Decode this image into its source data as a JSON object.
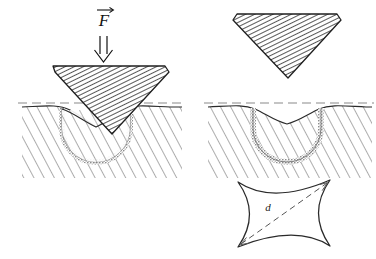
{
  "figure": {
    "title_visible": false,
    "background_color": "#ffffff",
    "ink_color": "#111111",
    "hatch_color": "#444444",
    "plastic_zone_color": "#808080",
    "dashed_surface_color": "#777777"
  },
  "labels": {
    "force": "F",
    "force_vector_accent": "→",
    "force_arrow_glyph": "⇓",
    "diagonal": "d"
  },
  "panels": [
    {
      "id": "loaded-indentation",
      "name": "Indenter under load pressed into specimen",
      "position": "top-left",
      "elements": [
        "force-vector-label",
        "force-double-arrow",
        "pyramid-indenter",
        "specimen-block",
        "original-surface-dashed-line",
        "pile-up-profile",
        "plastic-zone-hemisphere"
      ]
    },
    {
      "id": "retracted-indenter",
      "name": "Indenter lifted away from specimen",
      "position": "top-right",
      "elements": [
        "pyramid-indenter"
      ]
    },
    {
      "id": "residual-impression",
      "name": "Residual crater after unloading",
      "position": "middle-right",
      "elements": [
        "specimen-block",
        "original-surface-dashed-line",
        "residual-crater-profile",
        "plastic-zone-hemisphere"
      ]
    },
    {
      "id": "plan-view-impression",
      "name": "Plan view of pincushion indentation mark with diagonal",
      "position": "bottom-right",
      "elements": [
        "concave-square-impression",
        "diagonal-dashed-arrow",
        "diagonal-label"
      ]
    }
  ]
}
